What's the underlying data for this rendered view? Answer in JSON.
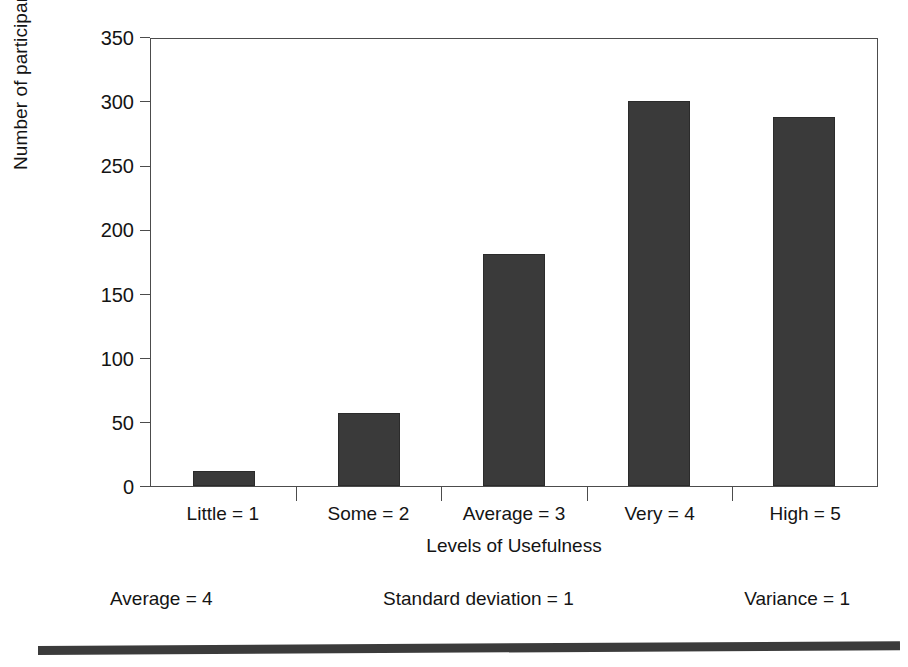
{
  "chart_data": {
    "type": "bar",
    "title": "",
    "categories": [
      "Little = 1",
      "Some = 2",
      "Average = 3",
      "Very = 4",
      "High = 5"
    ],
    "values": [
      12,
      57,
      181,
      300,
      288
    ],
    "xlabel": "Levels of Usefulness",
    "ylabel": "Number of participants",
    "ylim": [
      0,
      350
    ],
    "yticks": [
      0,
      50,
      100,
      150,
      200,
      250,
      300,
      350
    ],
    "ytick_labels": [
      "0",
      "50",
      "100",
      "150",
      "200",
      "250",
      "300",
      "350"
    ],
    "grid": false,
    "legend": null,
    "bar_color": "#3a3a3a",
    "axis_color": "#4c4c4c",
    "background": "#ffffff"
  },
  "footer_stats": [
    {
      "label": "Average = 4"
    },
    {
      "label": "Standard deviation = 1"
    },
    {
      "label": "Variance = 1"
    }
  ]
}
